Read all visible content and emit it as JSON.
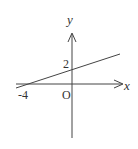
{
  "diagram": {
    "type": "coordinate-plane-line",
    "axes": {
      "x_label": "x",
      "y_label": "y",
      "origin_label": "O"
    },
    "tick_labels": {
      "x_intercept": "-4",
      "y_intercept": "2"
    },
    "line": {
      "description": "straight line through (-4, 0) and (0, 2)",
      "x_intercept": -4,
      "y_intercept": 2
    },
    "colors": {
      "stroke": "#444444",
      "background": "#ffffff"
    }
  }
}
